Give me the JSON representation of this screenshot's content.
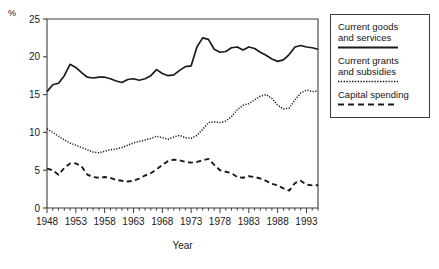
{
  "axis": {
    "unit_label": "%",
    "xaxis_title": "Year",
    "y_ticks": [
      "0",
      "5",
      "10",
      "15",
      "20",
      "25"
    ],
    "x_ticks": [
      "1948",
      "1953",
      "1958",
      "1963",
      "1968",
      "1973",
      "1978",
      "1983",
      "1988",
      "1993"
    ]
  },
  "legend": {
    "entries": [
      {
        "label": "Current goods\nand services",
        "style": "solid",
        "color": "#1a1a1a"
      },
      {
        "label": "Current grants\nand subsidies",
        "style": "dotted",
        "color": "#1a1a1a"
      },
      {
        "label": "Capital spending",
        "style": "dashed",
        "color": "#1a1a1a"
      }
    ]
  },
  "chart_data": {
    "type": "line",
    "title": "",
    "xlabel": "Year",
    "ylabel": "%",
    "xlim": [
      1948,
      1995
    ],
    "ylim": [
      0,
      25
    ],
    "grid": false,
    "legend_position": "right-outside",
    "x": [
      1948,
      1949,
      1950,
      1951,
      1952,
      1953,
      1954,
      1955,
      1956,
      1957,
      1958,
      1959,
      1960,
      1961,
      1962,
      1963,
      1964,
      1965,
      1966,
      1967,
      1968,
      1969,
      1970,
      1971,
      1972,
      1973,
      1974,
      1975,
      1976,
      1977,
      1978,
      1979,
      1980,
      1981,
      1982,
      1983,
      1984,
      1985,
      1986,
      1987,
      1988,
      1989,
      1990,
      1991,
      1992,
      1993,
      1994,
      1995
    ],
    "series": [
      {
        "name": "Current goods and services",
        "style": "solid",
        "values": [
          15.4,
          16.3,
          16.5,
          17.5,
          19.0,
          18.6,
          17.9,
          17.3,
          17.2,
          17.3,
          17.3,
          17.1,
          16.8,
          16.6,
          17.0,
          17.1,
          16.9,
          17.1,
          17.5,
          18.3,
          17.8,
          17.5,
          17.6,
          18.2,
          18.7,
          18.8,
          21.3,
          22.5,
          22.3,
          21.0,
          20.6,
          20.7,
          21.2,
          21.3,
          20.9,
          21.3,
          21.1,
          20.6,
          20.2,
          19.7,
          19.4,
          19.6,
          20.3,
          21.3,
          21.5,
          21.3,
          21.2,
          21.0
        ]
      },
      {
        "name": "Current grants and subsidies",
        "style": "dotted",
        "values": [
          10.5,
          10.0,
          9.5,
          9.0,
          8.6,
          8.3,
          8.0,
          7.7,
          7.4,
          7.3,
          7.5,
          7.7,
          7.8,
          8.0,
          8.3,
          8.6,
          8.8,
          9.0,
          9.2,
          9.5,
          9.3,
          9.1,
          9.4,
          9.6,
          9.3,
          9.2,
          9.6,
          10.4,
          11.3,
          11.4,
          11.3,
          11.5,
          12.1,
          13.0,
          13.6,
          13.8,
          14.3,
          14.8,
          15.0,
          14.5,
          13.6,
          13.1,
          13.2,
          14.3,
          15.2,
          15.6,
          15.4,
          15.5
        ]
      },
      {
        "name": "Capital spending",
        "style": "dashed",
        "values": [
          5.2,
          5.0,
          4.4,
          5.3,
          5.9,
          5.9,
          5.5,
          4.4,
          4.1,
          4.0,
          4.1,
          4.0,
          3.7,
          3.6,
          3.5,
          3.6,
          3.9,
          4.3,
          4.6,
          5.1,
          5.7,
          6.2,
          6.4,
          6.3,
          6.1,
          6.0,
          6.1,
          6.3,
          6.5,
          5.7,
          5.0,
          4.8,
          4.6,
          4.1,
          4.0,
          4.2,
          4.1,
          3.9,
          3.6,
          3.2,
          3.0,
          2.6,
          2.3,
          3.3,
          3.6,
          3.1,
          3.0,
          3.0
        ]
      }
    ]
  }
}
